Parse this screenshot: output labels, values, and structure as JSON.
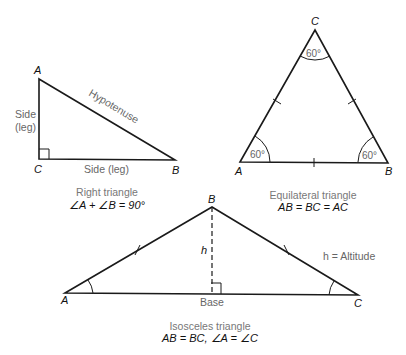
{
  "right_triangle": {
    "vertices": {
      "A": "A",
      "B": "B",
      "C": "C"
    },
    "labels": {
      "hypotenuse": "Hypotenuse",
      "side_line1": "Side",
      "side_line2": "(leg)",
      "bottom_side": "Side (leg)"
    },
    "caption": "Right triangle",
    "formula": "∠A + ∠B = 90°"
  },
  "equilateral_triangle": {
    "vertices": {
      "A": "A",
      "B": "B",
      "C": "C"
    },
    "angles": {
      "A": "60°",
      "B": "60°",
      "C": "60°"
    },
    "caption": "Equilateral triangle",
    "formula": "AB = BC = AC"
  },
  "isosceles_triangle": {
    "vertices": {
      "A": "A",
      "B": "B",
      "C": "C"
    },
    "labels": {
      "altitude": "h",
      "base": "Base",
      "legend": "h = Altitude"
    },
    "caption": "Isosceles triangle",
    "formula": "AB = BC, ∠A = ∠C"
  }
}
